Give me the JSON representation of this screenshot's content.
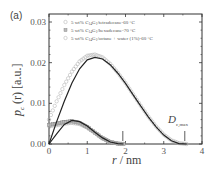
{
  "chart_data": {
    "type": "line",
    "panel_label": "(a)",
    "title": "",
    "xlabel": "r / nm",
    "ylabel": "p_c (r) [a.u.]",
    "xlim": [
      0,
      4
    ],
    "ylim": [
      0,
      0.03
    ],
    "xticks": [
      "0",
      "1",
      "2",
      "3",
      "4"
    ],
    "yticks": [
      "0.00",
      "0.01",
      "0.02",
      "0.03"
    ],
    "grid": false,
    "legend_position": "upper-left",
    "annotation": "D_c,max",
    "markers_r": [
      1.93,
      3.55
    ],
    "series": [
      {
        "name": "5 wt% C14G1/tetradecane-60 °C",
        "marker": "open-circle",
        "x": [
          0,
          0.2,
          0.4,
          0.6,
          0.8,
          1.0,
          1.2,
          1.4,
          1.6,
          1.8,
          2.0,
          2.2,
          2.4,
          2.6,
          2.8,
          3.0,
          3.2,
          3.4,
          3.6
        ],
        "values": [
          0.006,
          0.0105,
          0.0145,
          0.0178,
          0.0203,
          0.0217,
          0.022,
          0.0213,
          0.0197,
          0.0175,
          0.015,
          0.0122,
          0.0094,
          0.0067,
          0.0043,
          0.0023,
          0.0009,
          0.0002,
          0.0
        ]
      },
      {
        "name": "5 wt% C14G1/hexadecane-70 °C",
        "marker": "filled-square",
        "x": [
          0,
          0.2,
          0.4,
          0.6,
          0.8,
          1.0,
          1.2,
          1.4,
          1.6,
          1.8,
          2.0
        ],
        "values": [
          0.0047,
          0.005,
          0.0054,
          0.0056,
          0.0052,
          0.0042,
          0.0028,
          0.0014,
          0.0005,
          0.0001,
          0.0
        ]
      },
      {
        "name": "5 wt% C14G1/octane + water (1%)-60 °C",
        "marker": "open-circle",
        "x": [
          0,
          0.2,
          0.4,
          0.6,
          0.8,
          1.0,
          1.2,
          1.4,
          1.6,
          1.8,
          2.0
        ],
        "values": [
          0.0044,
          0.0046,
          0.005,
          0.0052,
          0.0049,
          0.004,
          0.0027,
          0.0014,
          0.0005,
          0.0001,
          0.0
        ]
      },
      {
        "name": "fit (tetradecane)",
        "marker": "line",
        "x": [
          0,
          0.2,
          0.4,
          0.6,
          0.8,
          1.0,
          1.2,
          1.4,
          1.6,
          1.8,
          2.0,
          2.2,
          2.4,
          2.6,
          2.8,
          3.0,
          3.2,
          3.4,
          3.6
        ],
        "values": [
          0.0,
          0.0055,
          0.0105,
          0.015,
          0.0185,
          0.0207,
          0.0213,
          0.0209,
          0.0195,
          0.0174,
          0.0149,
          0.0121,
          0.0093,
          0.0066,
          0.0042,
          0.0022,
          0.0008,
          0.0001,
          0.0
        ]
      },
      {
        "name": "fit (short chains)",
        "marker": "line",
        "x": [
          0,
          0.2,
          0.4,
          0.6,
          0.8,
          1.0,
          1.2,
          1.4,
          1.6,
          1.8,
          1.95
        ],
        "values": [
          0.0,
          0.0025,
          0.0048,
          0.0058,
          0.0055,
          0.0044,
          0.0029,
          0.0015,
          0.0005,
          0.0001,
          0.0
        ]
      }
    ]
  },
  "legend": {
    "items": [
      {
        "label_pre": "5 wt% C",
        "sub1": "14",
        "mid": "G",
        "sub2": "1",
        "label_post": "/tetradecane-60 °C",
        "marker": "open-circle"
      },
      {
        "label_pre": "5 wt% C",
        "sub1": "14",
        "mid": "G",
        "sub2": "1",
        "label_post": "/hexadecane-70 °C",
        "marker": "filled-square"
      },
      {
        "label_pre": "5 wt% C",
        "sub1": "14",
        "mid": "G",
        "sub2": "1",
        "label_post": "/octane + water (1%)-60 °C",
        "marker": "open-circle"
      }
    ]
  },
  "labels": {
    "panel": "(a)",
    "ylabel_main": "p",
    "ylabel_sub": "c",
    "ylabel_rest": " (r) [a.u.]",
    "xlabel_var": "r",
    "xlabel_unit": " / nm",
    "annot_main": "D",
    "annot_sub": "c,max"
  },
  "colors": {
    "axis": "#333333",
    "fit_line": "#222222",
    "markers": "#999999",
    "text": "#555555"
  }
}
